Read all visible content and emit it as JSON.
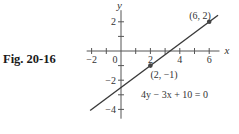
{
  "figure": {
    "caption": "Fig. 20-16"
  },
  "chart_data": {
    "type": "line",
    "title": "",
    "xlabel": "x",
    "ylabel": "y",
    "xlim": [
      -2.2,
      6.7
    ],
    "ylim": [
      -4.5,
      3.0
    ],
    "x_ticks": [
      -2,
      -1,
      0,
      1,
      2,
      3,
      4,
      5,
      6
    ],
    "x_tick_labels": [
      {
        "value": -2,
        "label": "−2"
      },
      {
        "value": 0,
        "label": "0"
      },
      {
        "value": 2,
        "label": "2"
      },
      {
        "value": 4,
        "label": "4"
      },
      {
        "value": 6,
        "label": "6"
      }
    ],
    "y_ticks": [
      -4,
      -3,
      -2,
      -1,
      1,
      2
    ],
    "y_tick_labels": [
      {
        "value": 2,
        "label": "2"
      },
      {
        "value": -2,
        "label": "−2"
      },
      {
        "value": -4,
        "label": "−4"
      }
    ],
    "grid": false,
    "series": [
      {
        "name": "4y − 3x + 10 = 0",
        "equation": "4y - 3x + 10 = 0",
        "slope": 0.75,
        "intercept": -2.5,
        "x": [
          -2.1,
          6.6
        ],
        "y": [
          -4.075,
          2.45
        ],
        "color": "#3a3a3a"
      }
    ],
    "points": [
      {
        "x": 6,
        "y": 2,
        "label": "(6, 2)"
      },
      {
        "x": 2,
        "y": -1,
        "label": "(2, −1)"
      }
    ],
    "annotations": [
      {
        "text": "4y − 3x + 10 = 0",
        "x": 4.0,
        "y": -3.0
      }
    ]
  }
}
